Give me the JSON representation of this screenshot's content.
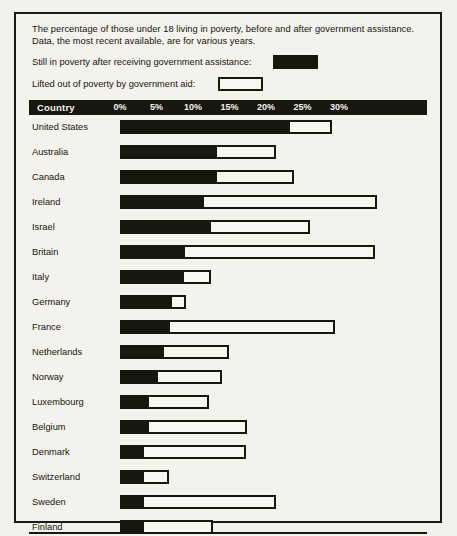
{
  "caption": "The percentage of those under 18 living in poverty, before and after government assistance.  Data, the most recent available, are for various years.",
  "legend": [
    {
      "label": "Still in poverty after receiving government assistance:",
      "swatch": "filled-black-swatch"
    },
    {
      "label": "Lifted out of poverty by government aid:",
      "swatch": "outlined-white-swatch"
    }
  ],
  "header": {
    "country_label": "Country"
  },
  "colors": {
    "ink": "#17160f",
    "paper": "#f4f2ec",
    "bar_fill": "#f8f7f2"
  },
  "chart_data": {
    "type": "bar",
    "title": "The percentage of those under 18 living in poverty, before and after government assistance.",
    "orientation": "horizontal",
    "stacked": true,
    "xlabel": "",
    "ylabel": "Country",
    "xlim": [
      0,
      35
    ],
    "grid": false,
    "legend_position": "top",
    "tick_labels": [
      "0%",
      "5%",
      "10%",
      "15%",
      "20%",
      "25%",
      "30%"
    ],
    "tick_values": [
      0,
      5,
      10,
      15,
      20,
      25,
      30
    ],
    "categories": [
      "United States",
      "Australia",
      "Canada",
      "Ireland",
      "Israel",
      "Britain",
      "Italy",
      "Germany",
      "France",
      "Netherlands",
      "Norway",
      "Luxembourg",
      "Belgium",
      "Denmark",
      "Switzerland",
      "Sweden",
      "Finland"
    ],
    "series": [
      {
        "name": "Still in poverty after receiving government assistance",
        "values": [
          23.3,
          13.3,
          13.3,
          11.5,
          12.5,
          8.9,
          8.8,
          7.1,
          6.8,
          6.0,
          5.2,
          4.0,
          4.0,
          3.3,
          3.3,
          3.3,
          3.3
        ]
      },
      {
        "name": "Lifted out of poverty by government aid",
        "values": [
          5.7,
          8.1,
          10.5,
          23.7,
          13.5,
          26.0,
          3.7,
          1.9,
          22.6,
          8.9,
          8.8,
          8.2,
          13.4,
          14.0,
          3.4,
          18.1,
          9.4
        ]
      }
    ],
    "totals": [
      29.0,
      21.4,
      23.8,
      35.2,
      26.0,
      34.9,
      12.5,
      9.0,
      29.4,
      14.9,
      14.0,
      12.2,
      17.4,
      17.3,
      6.7,
      21.4,
      12.7
    ]
  }
}
